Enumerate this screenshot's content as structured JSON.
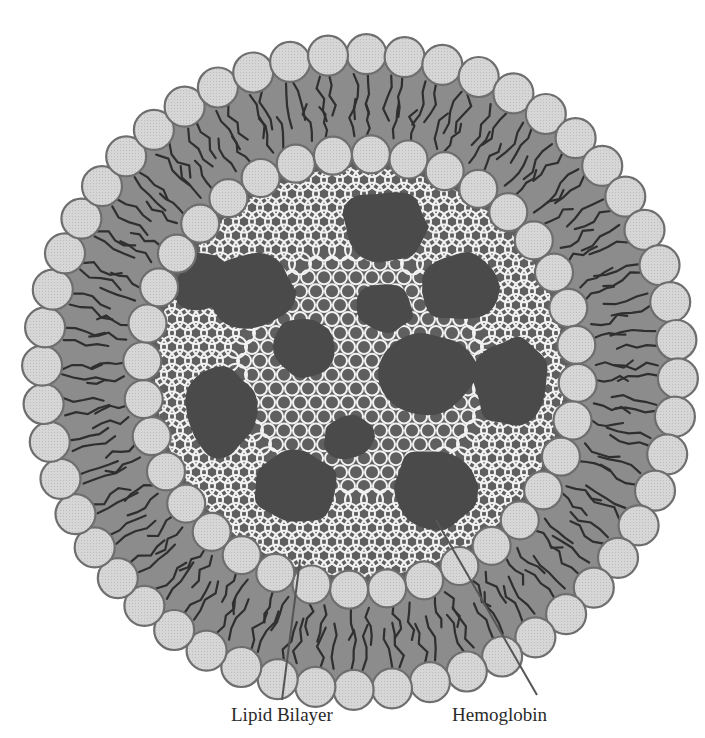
{
  "figure": {
    "labels": {
      "lipid_bilayer": "Lipid Bilayer",
      "hemoglobin": "Hemoglobin"
    },
    "components": {
      "outer_leaflet_headgroups": 52,
      "inner_leaflet_headgroups": 36,
      "hemoglobin_molecules": 12
    },
    "colors": {
      "background": "#ffffff",
      "headgroup_fill": "#d9d9d9",
      "headgroup_stroke": "#6e6e6e",
      "tail_region": "#8c8c8c",
      "tail_line": "#2f2f2f",
      "core": "#5f5f5f",
      "mesh": "#f2f2f2",
      "hemoglobin": "#4a4a4a",
      "leader_line": "#555555",
      "label_text": "#2a2a2a"
    }
  }
}
